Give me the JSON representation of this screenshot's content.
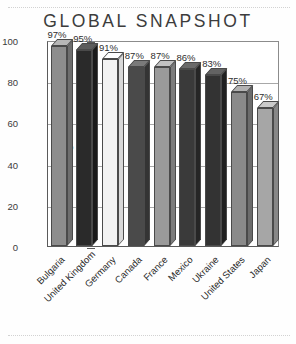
{
  "title": "GLOBAL SNAPSHOT",
  "chart_data": {
    "type": "bar",
    "title": "GLOBAL SNAPSHOT",
    "xlabel": "",
    "ylabel": "Percentage",
    "ylim": [
      0,
      100
    ],
    "yticks": [
      0,
      20,
      40,
      60,
      80,
      100
    ],
    "grid": true,
    "legend": false,
    "value_suffix": "%",
    "categories": [
      "Bulgaria",
      "United Kingdom",
      "Germany",
      "Canada",
      "France",
      "Mexico",
      "Ukraine",
      "United States",
      "Japan"
    ],
    "values": [
      97,
      95,
      91,
      87,
      87,
      86,
      83,
      75,
      67
    ],
    "value_labels": [
      "97%",
      "95%",
      "91%",
      "87%",
      "87%",
      "86%",
      "83%",
      "75%",
      "67%"
    ],
    "bar_colors": [
      "#8d8d8d",
      "#2a2a2a",
      "#f2f2f2",
      "#4a4a4a",
      "#9a9a9a",
      "#3a3a3a",
      "#333333",
      "#8a8a8a",
      "#a6a6a6"
    ],
    "bar_top_colors": [
      "#b7b7b7",
      "#5c5c5c",
      "#ffffff",
      "#7a7a7a",
      "#c2c2c2",
      "#6a6a6a",
      "#636363",
      "#b2b2b2",
      "#cacaca"
    ],
    "bar_side_colors": [
      "#6e6e6e",
      "#1a1a1a",
      "#d8d8d8",
      "#343434",
      "#7c7c7c",
      "#262626",
      "#202020",
      "#6c6c6c",
      "#878787"
    ]
  }
}
